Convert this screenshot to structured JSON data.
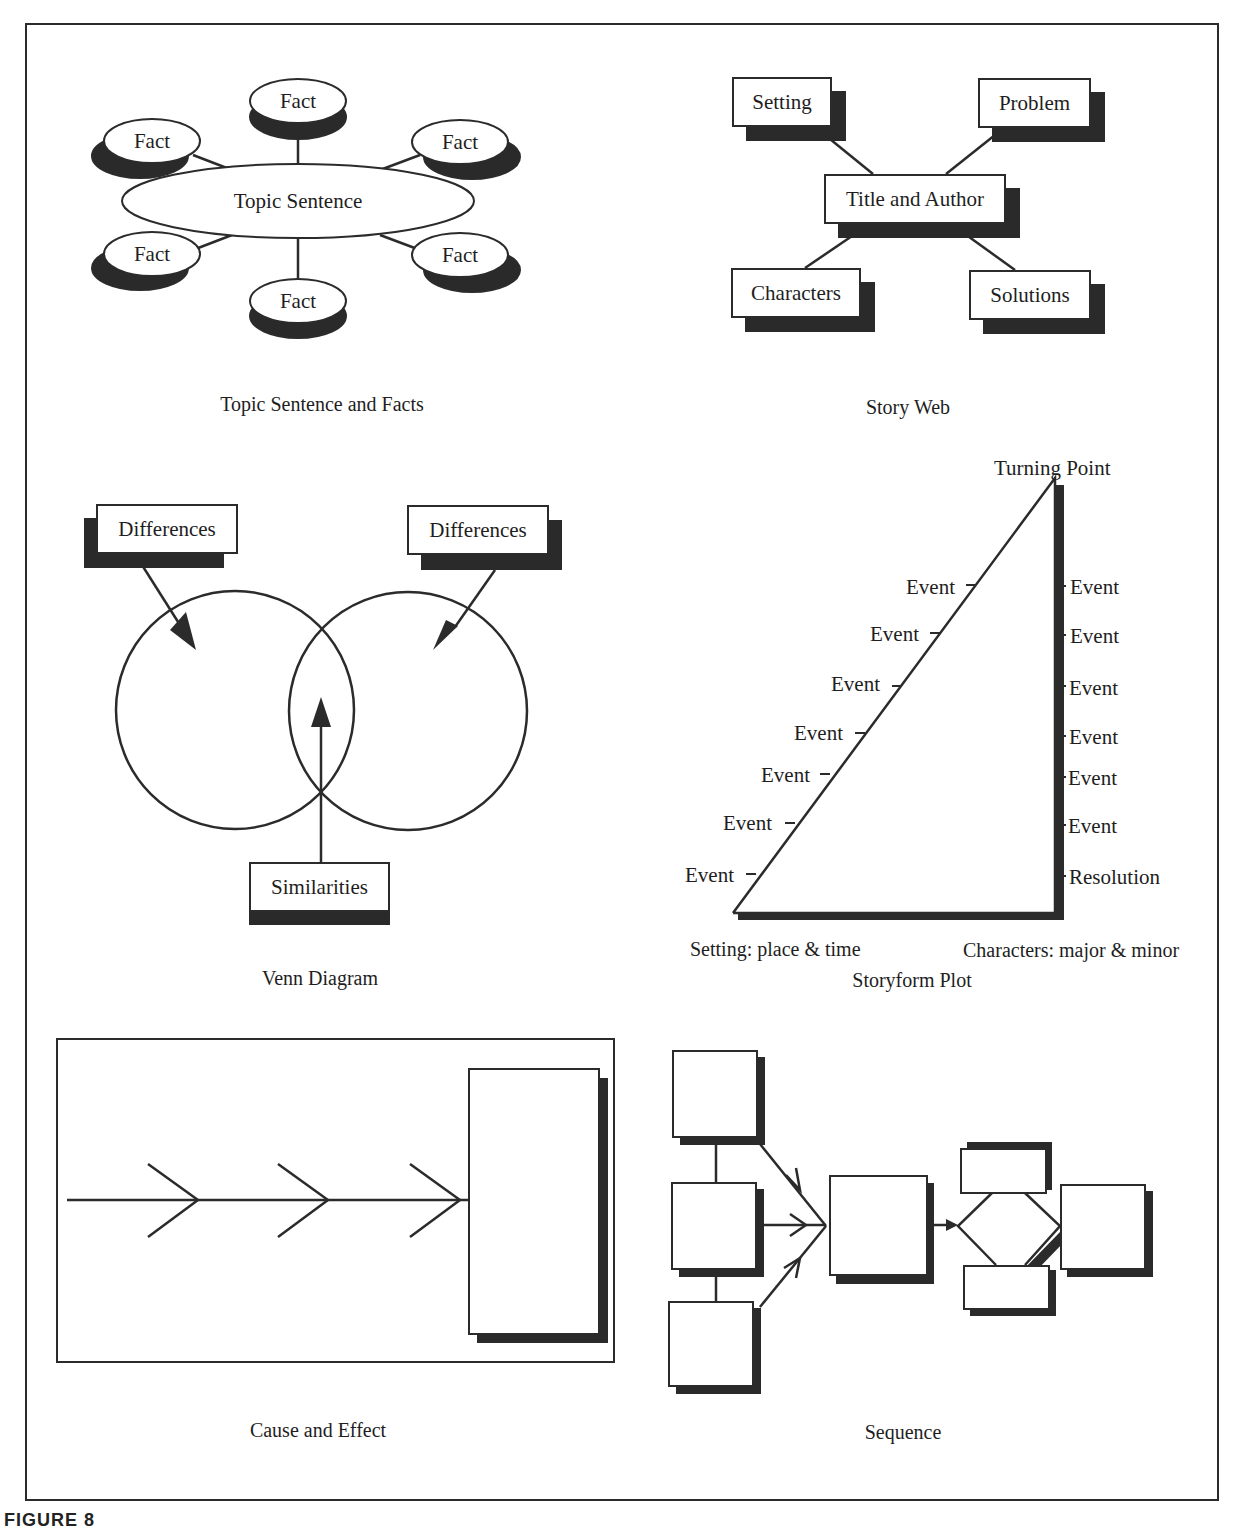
{
  "panels": {
    "topic": {
      "caption": "Topic Sentence and Facts",
      "center": "Topic Sentence",
      "facts": [
        "Fact",
        "Fact",
        "Fact",
        "Fact",
        "Fact",
        "Fact"
      ]
    },
    "storyweb": {
      "caption": "Story Web",
      "center": "Title and Author",
      "nodes": [
        "Setting",
        "Problem",
        "Characters",
        "Solutions"
      ]
    },
    "venn": {
      "caption": "Venn Diagram",
      "left_label": "Differences",
      "right_label": "Differences",
      "bottom_label": "Similarities"
    },
    "plot": {
      "caption": "Storyform Plot",
      "peak": "Turning Point",
      "rising_events": [
        "Event",
        "Event",
        "Event",
        "Event",
        "Event",
        "Event",
        "Event"
      ],
      "falling_events": [
        "Event",
        "Event",
        "Event",
        "Event",
        "Event",
        "Event"
      ],
      "resolution": "Resolution",
      "base_left": "Setting: place & time",
      "base_right": "Characters: major & minor"
    },
    "cause": {
      "caption": "Cause and Effect"
    },
    "sequence": {
      "caption": "Sequence"
    }
  },
  "figure_caption": "FIGURE 8"
}
